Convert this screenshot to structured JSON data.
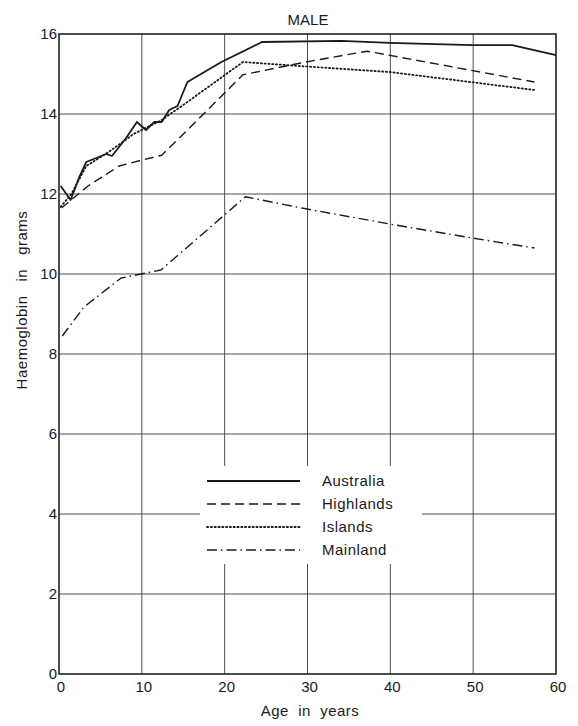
{
  "chart_data": {
    "type": "line",
    "title": "MALE",
    "xlabel": "Age  in  years",
    "ylabel": "Haemoglobin   in   grams",
    "xlim": [
      0,
      60
    ],
    "ylim": [
      0,
      16
    ],
    "x_ticks": [
      0,
      10,
      20,
      30,
      40,
      50,
      60
    ],
    "y_ticks": [
      0,
      2,
      4,
      6,
      8,
      10,
      12,
      14,
      16
    ],
    "grid": true,
    "legend_position": "center-lower",
    "series": [
      {
        "name": "Australia",
        "style": "solid",
        "points": [
          [
            0.2,
            12.2
          ],
          [
            1.4,
            11.85
          ],
          [
            2.4,
            12.4
          ],
          [
            3.3,
            12.8
          ],
          [
            5.7,
            13.0
          ],
          [
            6.4,
            12.95
          ],
          [
            8.1,
            13.4
          ],
          [
            9.4,
            13.8
          ],
          [
            10.5,
            13.6
          ],
          [
            11.5,
            13.8
          ],
          [
            12.4,
            13.8
          ],
          [
            13.3,
            14.1
          ],
          [
            14.3,
            14.2
          ],
          [
            15.5,
            14.8
          ],
          [
            19.6,
            15.3
          ],
          [
            24.5,
            15.8
          ],
          [
            34.1,
            15.83
          ],
          [
            39.9,
            15.78
          ],
          [
            49.9,
            15.72
          ],
          [
            54.7,
            15.72
          ],
          [
            60.0,
            15.47
          ]
        ]
      },
      {
        "name": "Highlands",
        "style": "dashed",
        "points": [
          [
            0.3,
            11.65
          ],
          [
            3.5,
            12.2
          ],
          [
            7.25,
            12.7
          ],
          [
            9.7,
            12.83
          ],
          [
            12.4,
            12.97
          ],
          [
            15.5,
            13.6
          ],
          [
            22.2,
            14.98
          ],
          [
            29.8,
            15.3
          ],
          [
            37.2,
            15.57
          ],
          [
            57.4,
            14.8
          ]
        ]
      },
      {
        "name": "Islands",
        "style": "dotted",
        "points": [
          [
            0.2,
            11.68
          ],
          [
            1.5,
            12.0
          ],
          [
            3.3,
            12.7
          ],
          [
            6.0,
            13.05
          ],
          [
            9.0,
            13.5
          ],
          [
            12.4,
            13.85
          ],
          [
            15.5,
            14.3
          ],
          [
            22.2,
            15.3
          ],
          [
            29.0,
            15.2
          ],
          [
            39.9,
            15.05
          ],
          [
            57.4,
            14.6
          ]
        ]
      },
      {
        "name": "Mainland",
        "style": "dashdot",
        "points": [
          [
            0.4,
            8.45
          ],
          [
            3.0,
            9.17
          ],
          [
            7.5,
            9.9
          ],
          [
            9.9,
            10.0
          ],
          [
            12.3,
            10.1
          ],
          [
            22.5,
            11.93
          ],
          [
            29.8,
            11.63
          ],
          [
            39.9,
            11.25
          ],
          [
            49.9,
            10.9
          ],
          [
            57.4,
            10.65
          ]
        ]
      }
    ]
  },
  "legend": {
    "items": [
      {
        "label": "Australia"
      },
      {
        "label": "Highlands"
      },
      {
        "label": "Islands"
      },
      {
        "label": "Mainland"
      }
    ]
  },
  "colors": {
    "line": "#1a1a1a",
    "grid": "#3a3a3a",
    "background": "#ffffff"
  }
}
